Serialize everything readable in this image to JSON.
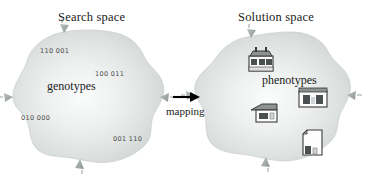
{
  "figure": {
    "type": "diagram",
    "background_color": "#ffffff",
    "blob_fill": "#d4d8d6",
    "blob_highlight": "#f2f4f3",
    "text_color": "#1a1a1a",
    "code_color": "#4a4a4a",
    "arrow_color": "#000000",
    "marker_color": "#9aa0a0"
  },
  "left_region": {
    "title": "Search space",
    "inner_label": "genotypes",
    "genotype_codes": [
      {
        "value": "110 001",
        "x": 40,
        "y": 47
      },
      {
        "value": "100 011",
        "x": 95,
        "y": 70
      },
      {
        "value": "010 000",
        "x": 21,
        "y": 114
      },
      {
        "value": "001 110",
        "x": 113,
        "y": 135
      }
    ],
    "edge_markers": [
      "up",
      "down",
      "left",
      "right"
    ]
  },
  "mapping": {
    "label": "mapping",
    "arrow": "right-arrow"
  },
  "right_region": {
    "title": "Solution space",
    "inner_label": "phenotypes",
    "phenotype_icons": [
      {
        "name": "factory-building-icon",
        "x": 248,
        "y": 50,
        "w": 26,
        "h": 22
      },
      {
        "name": "wide-building-icon",
        "x": 298,
        "y": 88,
        "w": 30,
        "h": 21
      },
      {
        "name": "small-house-icon",
        "x": 250,
        "y": 103,
        "w": 27,
        "h": 21
      },
      {
        "name": "tower-building-icon",
        "x": 302,
        "y": 127,
        "w": 21,
        "h": 27
      }
    ],
    "edge_markers": [
      "up",
      "down",
      "left",
      "right"
    ]
  }
}
